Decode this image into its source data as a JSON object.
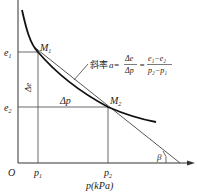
{
  "diagram": {
    "axes": {
      "origin_label": "O",
      "x_label": "p(kPa)",
      "y_axis_label": ""
    },
    "points": {
      "m1": "M",
      "m1_sub": "1",
      "m2": "M",
      "m2_sub": "2"
    },
    "y_ticks": {
      "e1": "e",
      "e1_sub": "1",
      "e2": "e",
      "e2_sub": "2"
    },
    "x_ticks": {
      "p1": "p",
      "p1_sub": "1",
      "p2": "p",
      "p2_sub": "2"
    },
    "deltas": {
      "delta_e": "Δe",
      "delta_p": "Δp"
    },
    "angle_label": "β",
    "formula": {
      "prefix": "斜率",
      "a": "a=",
      "frac1_num": "Δe",
      "frac1_den": "Δp",
      "eq": "=",
      "frac2_num": "e₁−e₂",
      "frac2_den": "p₂−p₁"
    },
    "colors": {
      "line": "#333333",
      "curve": "#111111"
    }
  }
}
